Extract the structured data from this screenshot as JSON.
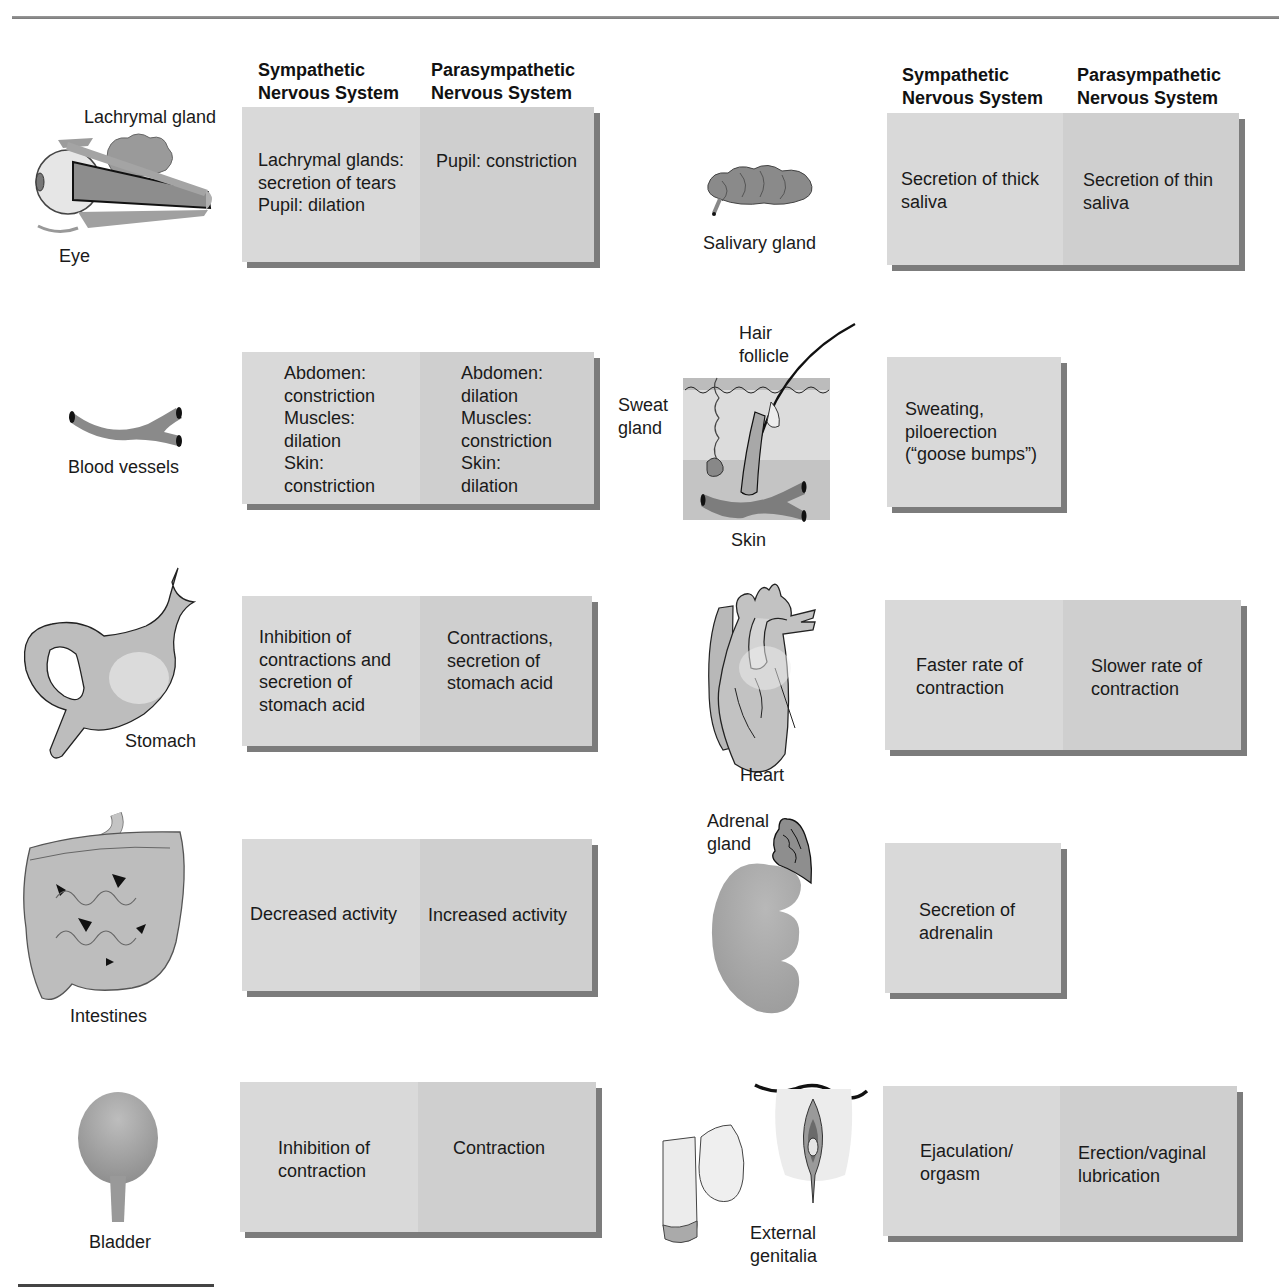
{
  "headers": {
    "sympathetic": [
      "Sympathetic",
      "Nervous System"
    ],
    "parasympathetic": [
      "Parasympathetic",
      "Nervous System"
    ]
  },
  "left_column": [
    {
      "organ": "Eye",
      "extra_label": "Lachrymal gland",
      "icon": "eye-icon",
      "sympathetic": [
        "Lachrymal glands:",
        "secretion of tears",
        "Pupil: dilation"
      ],
      "parasympathetic": [
        "Pupil: constriction"
      ]
    },
    {
      "organ": "Blood vessels",
      "icon": "blood-vessel-icon",
      "sympathetic": [
        "Abdomen:",
        "constriction",
        "Muscles:",
        "dilation",
        "Skin:",
        "constriction"
      ],
      "parasympathetic": [
        "Abdomen:",
        "dilation",
        "Muscles:",
        "constriction",
        "Skin:",
        "dilation"
      ]
    },
    {
      "organ": "Stomach",
      "icon": "stomach-icon",
      "sympathetic": [
        "Inhibition of",
        "contractions and",
        "secretion of",
        "stomach acid"
      ],
      "parasympathetic": [
        "Contractions,",
        "secretion of",
        "stomach acid"
      ]
    },
    {
      "organ": "Intestines",
      "icon": "intestines-icon",
      "sympathetic": [
        "Decreased activity"
      ],
      "parasympathetic": [
        "Increased activity"
      ]
    },
    {
      "organ": "Bladder",
      "icon": "bladder-icon",
      "sympathetic": [
        "Inhibition of",
        "contraction"
      ],
      "parasympathetic": [
        "Contraction"
      ]
    }
  ],
  "right_column": [
    {
      "organ": "Salivary gland",
      "icon": "salivary-gland-icon",
      "sympathetic": [
        "Secretion of thick",
        "saliva"
      ],
      "parasympathetic": [
        "Secretion of thin",
        "saliva"
      ]
    },
    {
      "organ": "Skin",
      "extra_labels": [
        "Hair",
        "follicle",
        "Sweat",
        "gland"
      ],
      "icon": "skin-icon",
      "sympathetic": [
        "Sweating,",
        "piloerection",
        "(“goose bumps”)"
      ],
      "parasympathetic": []
    },
    {
      "organ": "Heart",
      "icon": "heart-icon",
      "sympathetic": [
        "Faster rate of",
        "contraction"
      ],
      "parasympathetic": [
        "Slower rate of",
        "contraction"
      ]
    },
    {
      "organ_lines": [
        "Adrenal",
        "gland"
      ],
      "icon": "adrenal-kidney-icon",
      "sympathetic": [
        "Secretion of",
        "adrenalin"
      ],
      "parasympathetic": []
    },
    {
      "organ_lines": [
        "External",
        "genitalia"
      ],
      "icon": "genitalia-icon",
      "sympathetic": [
        "Ejaculation/",
        "orgasm"
      ],
      "parasympathetic": [
        "Erection/vaginal",
        "lubrication"
      ]
    }
  ],
  "colors": {
    "symp_cell": "#d9d9d9",
    "para_cell": "#cfcfcf",
    "shadow": "#7c7c7c",
    "illustration": "#9a9a9a"
  }
}
